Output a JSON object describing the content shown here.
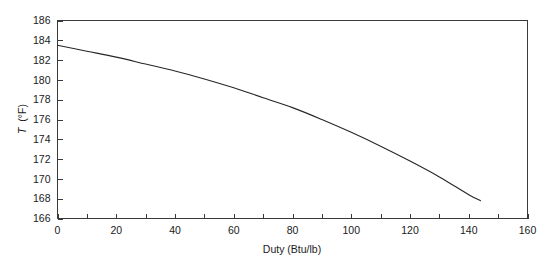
{
  "chart_data": {
    "type": "line",
    "title": "",
    "xlabel": "Duty (Btu/lb)",
    "ylabel": "T (°F)",
    "ylabel_symbol": "T",
    "ylabel_unit": "(°F)",
    "xlim": [
      0,
      160
    ],
    "ylim": [
      166,
      186
    ],
    "x_major_step": 20,
    "x_minor_step": 10,
    "y_major_step": 2,
    "grid": false,
    "legend": false,
    "frame": "box",
    "line_color": "#262626",
    "background_color": "#ffffff",
    "axis_color": "#3a3a3a",
    "xticks": [
      0,
      20,
      40,
      60,
      80,
      100,
      120,
      140,
      160
    ],
    "xtick_labels": [
      "0",
      "20",
      "40",
      "60",
      "80",
      "100",
      "120",
      "140",
      "160"
    ],
    "yticks": [
      166,
      168,
      170,
      172,
      174,
      176,
      178,
      180,
      182,
      184,
      186
    ],
    "ytick_labels": [
      "166",
      "168",
      "170",
      "172",
      "174",
      "176",
      "178",
      "180",
      "182",
      "184",
      "186"
    ],
    "series": [
      {
        "name": "T vs Duty",
        "x": [
          0,
          10,
          20,
          30,
          40,
          50,
          60,
          70,
          80,
          90,
          100,
          110,
          120,
          130,
          140,
          144
        ],
        "values": [
          183.5,
          182.9,
          182.3,
          181.6,
          180.9,
          180.1,
          179.2,
          178.2,
          177.2,
          176.0,
          174.7,
          173.3,
          171.8,
          170.2,
          168.4,
          167.8
        ]
      }
    ]
  }
}
